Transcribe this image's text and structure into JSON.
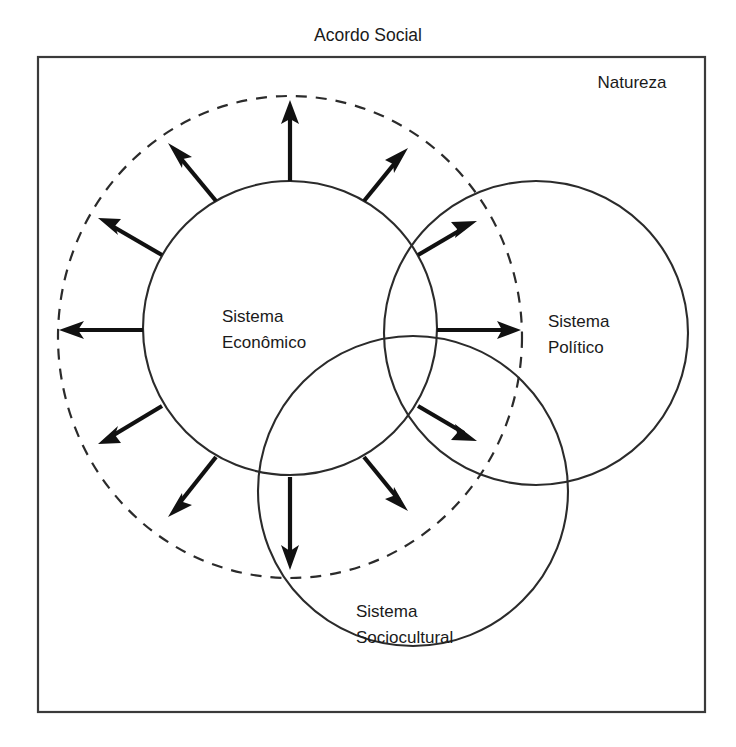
{
  "diagram": {
    "title": "Acordo Social",
    "frame_label": "Natureza",
    "systems": [
      {
        "id": "economico",
        "label_line1": "Sistema",
        "label_line2": "Econômico",
        "cx": 290,
        "cy": 328,
        "r": 147,
        "label_x": 222,
        "label_y": 322
      },
      {
        "id": "politico",
        "label_line1": "Sistema",
        "label_line2": "Político",
        "cx": 536,
        "cy": 333,
        "r": 152,
        "label_x": 548,
        "label_y": 327
      },
      {
        "id": "sociocultural",
        "label_line1": "Sistema",
        "label_line2": "Sociocultural",
        "cx": 413,
        "cy": 491,
        "r": 155,
        "label_x": 356,
        "label_y": 617
      }
    ],
    "boundary": {
      "name": "dashed-boundary-ellipse",
      "cx": 290,
      "cy": 337,
      "rx": 232,
      "ry": 241,
      "style": "dashed"
    },
    "arrows": {
      "count": 12,
      "description": "outward radial flows from Sistema Economico to the dashed social-agreement boundary",
      "angles_deg": [
        270,
        300,
        330,
        0,
        30,
        60,
        90,
        120,
        150,
        180,
        210,
        240
      ]
    },
    "colors": {
      "stroke": "#2b2b2b",
      "arrow": "#111111",
      "frame": "#3a3a3a",
      "background": "#ffffff",
      "text": "#1a1a1a"
    }
  }
}
